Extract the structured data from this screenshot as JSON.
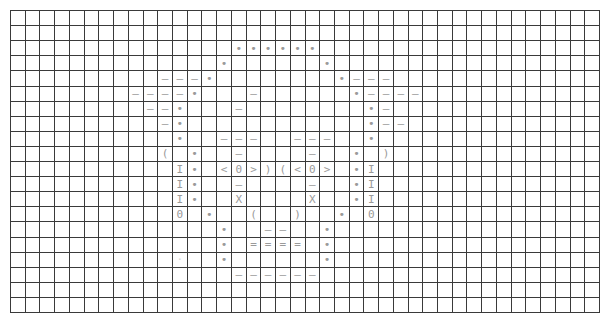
{
  "grid": {
    "columns": 40,
    "rows": 20,
    "line_color": "#3a3a3a",
    "glyph_color": "#9a9a9a"
  },
  "glyphs": [
    {
      "r": 2,
      "c": 15,
      "ch": "•"
    },
    {
      "r": 2,
      "c": 16,
      "ch": "•"
    },
    {
      "r": 2,
      "c": 17,
      "ch": "•"
    },
    {
      "r": 2,
      "c": 18,
      "ch": "•"
    },
    {
      "r": 2,
      "c": 19,
      "ch": "•"
    },
    {
      "r": 2,
      "c": 20,
      "ch": "•"
    },
    {
      "r": 3,
      "c": 14,
      "ch": "•"
    },
    {
      "r": 3,
      "c": 21,
      "ch": "•"
    },
    {
      "r": 4,
      "c": 10,
      "ch": "—"
    },
    {
      "r": 4,
      "c": 11,
      "ch": "—"
    },
    {
      "r": 4,
      "c": 12,
      "ch": "—"
    },
    {
      "r": 4,
      "c": 13,
      "ch": "•"
    },
    {
      "r": 4,
      "c": 22,
      "ch": "•"
    },
    {
      "r": 4,
      "c": 23,
      "ch": "—"
    },
    {
      "r": 4,
      "c": 24,
      "ch": "—"
    },
    {
      "r": 4,
      "c": 25,
      "ch": "—"
    },
    {
      "r": 5,
      "c": 8,
      "ch": "—"
    },
    {
      "r": 5,
      "c": 9,
      "ch": "—"
    },
    {
      "r": 5,
      "c": 10,
      "ch": "—"
    },
    {
      "r": 5,
      "c": 11,
      "ch": "—"
    },
    {
      "r": 5,
      "c": 12,
      "ch": "•"
    },
    {
      "r": 5,
      "c": 16,
      "ch": "—"
    },
    {
      "r": 5,
      "c": 23,
      "ch": "•"
    },
    {
      "r": 5,
      "c": 24,
      "ch": "—"
    },
    {
      "r": 5,
      "c": 25,
      "ch": "—"
    },
    {
      "r": 5,
      "c": 26,
      "ch": "—"
    },
    {
      "r": 5,
      "c": 27,
      "ch": "—"
    },
    {
      "r": 6,
      "c": 9,
      "ch": "—"
    },
    {
      "r": 6,
      "c": 10,
      "ch": "—"
    },
    {
      "r": 6,
      "c": 11,
      "ch": "•"
    },
    {
      "r": 6,
      "c": 15,
      "ch": "—"
    },
    {
      "r": 6,
      "c": 24,
      "ch": "•"
    },
    {
      "r": 6,
      "c": 25,
      "ch": "—"
    },
    {
      "r": 7,
      "c": 10,
      "ch": "—"
    },
    {
      "r": 7,
      "c": 11,
      "ch": "•"
    },
    {
      "r": 7,
      "c": 24,
      "ch": "•"
    },
    {
      "r": 7,
      "c": 25,
      "ch": "—"
    },
    {
      "r": 7,
      "c": 26,
      "ch": "—"
    },
    {
      "r": 8,
      "c": 11,
      "ch": "•"
    },
    {
      "r": 8,
      "c": 14,
      "ch": "—"
    },
    {
      "r": 8,
      "c": 15,
      "ch": "—"
    },
    {
      "r": 8,
      "c": 16,
      "ch": "—"
    },
    {
      "r": 8,
      "c": 19,
      "ch": "—"
    },
    {
      "r": 8,
      "c": 20,
      "ch": "—"
    },
    {
      "r": 8,
      "c": 21,
      "ch": "—"
    },
    {
      "r": 8,
      "c": 24,
      "ch": "•"
    },
    {
      "r": 9,
      "c": 10,
      "ch": "("
    },
    {
      "r": 9,
      "c": 12,
      "ch": "•"
    },
    {
      "r": 9,
      "c": 15,
      "ch": "—"
    },
    {
      "r": 9,
      "c": 20,
      "ch": "—"
    },
    {
      "r": 9,
      "c": 23,
      "ch": "•"
    },
    {
      "r": 9,
      "c": 25,
      "ch": ")"
    },
    {
      "r": 10,
      "c": 11,
      "ch": "I"
    },
    {
      "r": 10,
      "c": 12,
      "ch": "•"
    },
    {
      "r": 10,
      "c": 14,
      "ch": "<"
    },
    {
      "r": 10,
      "c": 15,
      "ch": "0"
    },
    {
      "r": 10,
      "c": 16,
      "ch": ">"
    },
    {
      "r": 10,
      "c": 17,
      "ch": ")"
    },
    {
      "r": 10,
      "c": 18,
      "ch": "("
    },
    {
      "r": 10,
      "c": 19,
      "ch": "<"
    },
    {
      "r": 10,
      "c": 20,
      "ch": "0"
    },
    {
      "r": 10,
      "c": 21,
      "ch": ">"
    },
    {
      "r": 10,
      "c": 23,
      "ch": "•"
    },
    {
      "r": 10,
      "c": 24,
      "ch": "I"
    },
    {
      "r": 11,
      "c": 11,
      "ch": "I"
    },
    {
      "r": 11,
      "c": 12,
      "ch": "•"
    },
    {
      "r": 11,
      "c": 15,
      "ch": "—"
    },
    {
      "r": 11,
      "c": 20,
      "ch": "—"
    },
    {
      "r": 11,
      "c": 23,
      "ch": "•"
    },
    {
      "r": 11,
      "c": 24,
      "ch": "I"
    },
    {
      "r": 12,
      "c": 11,
      "ch": "I"
    },
    {
      "r": 12,
      "c": 12,
      "ch": "•"
    },
    {
      "r": 12,
      "c": 15,
      "ch": "X"
    },
    {
      "r": 12,
      "c": 20,
      "ch": "X"
    },
    {
      "r": 12,
      "c": 23,
      "ch": "•"
    },
    {
      "r": 12,
      "c": 24,
      "ch": "I"
    },
    {
      "r": 13,
      "c": 11,
      "ch": "0"
    },
    {
      "r": 13,
      "c": 13,
      "ch": "•"
    },
    {
      "r": 13,
      "c": 16,
      "ch": "("
    },
    {
      "r": 13,
      "c": 19,
      "ch": ")"
    },
    {
      "r": 13,
      "c": 22,
      "ch": "•"
    },
    {
      "r": 13,
      "c": 24,
      "ch": "0"
    },
    {
      "r": 14,
      "c": 14,
      "ch": "•"
    },
    {
      "r": 14,
      "c": 17,
      "ch": "—"
    },
    {
      "r": 14,
      "c": 18,
      "ch": "—"
    },
    {
      "r": 14,
      "c": 21,
      "ch": "•"
    },
    {
      "r": 15,
      "c": 14,
      "ch": "•"
    },
    {
      "r": 15,
      "c": 16,
      "ch": "="
    },
    {
      "r": 15,
      "c": 17,
      "ch": "="
    },
    {
      "r": 15,
      "c": 18,
      "ch": "="
    },
    {
      "r": 15,
      "c": 19,
      "ch": "="
    },
    {
      "r": 15,
      "c": 21,
      "ch": "•"
    },
    {
      "r": 16,
      "c": 11,
      "ch": "·",
      "faint": true
    },
    {
      "r": 16,
      "c": 14,
      "ch": "•"
    },
    {
      "r": 16,
      "c": 21,
      "ch": "•"
    },
    {
      "r": 17,
      "c": 15,
      "ch": "—"
    },
    {
      "r": 17,
      "c": 16,
      "ch": "—"
    },
    {
      "r": 17,
      "c": 17,
      "ch": "—"
    },
    {
      "r": 17,
      "c": 18,
      "ch": "—"
    },
    {
      "r": 17,
      "c": 19,
      "ch": "—"
    },
    {
      "r": 17,
      "c": 20,
      "ch": "—"
    }
  ]
}
